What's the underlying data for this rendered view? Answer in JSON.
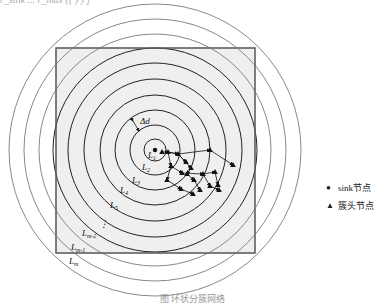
{
  "top_fragment": "r_sink  ...  r_max  ((  )  )  ]",
  "diagram": {
    "center": [
      155,
      150
    ],
    "square": {
      "x": 56,
      "y": 48,
      "w": 199,
      "h": 205,
      "fill": "#efefef",
      "stroke": "#666666"
    },
    "rings_black": [
      11,
      25,
      40,
      55,
      71,
      87,
      102
    ],
    "rings_gray": [
      116,
      131,
      146
    ],
    "ring_labels": [
      {
        "text": "L",
        "sub": "1",
        "x": 148,
        "y": 158
      },
      {
        "text": "L",
        "sub": "2",
        "x": 142,
        "y": 170
      },
      {
        "text": "L",
        "sub": "3",
        "x": 132,
        "y": 183
      },
      {
        "text": "L",
        "sub": "4",
        "x": 120,
        "y": 193
      },
      {
        "text": "L",
        "sub": "5",
        "x": 110,
        "y": 208
      },
      {
        "text": "L",
        "sub": "m-2",
        "x": 82,
        "y": 236
      },
      {
        "text": "L",
        "sub": "m-1",
        "x": 71,
        "y": 250
      },
      {
        "text": "L",
        "sub": "m",
        "x": 69,
        "y": 264
      }
    ],
    "delta_label": "Δd",
    "ellipsis": "⋮",
    "sink_color": "#111111",
    "edges": [
      [
        [
          162,
          152
        ],
        [
          168,
          152
        ],
        [
          178,
          154
        ]
      ],
      [
        [
          168,
          152
        ],
        [
          178,
          154
        ],
        [
          186,
          162
        ]
      ],
      [
        [
          178,
          154
        ],
        [
          210,
          150
        ],
        [
          233,
          165
        ]
      ],
      [
        [
          178,
          154
        ],
        [
          191,
          168
        ],
        [
          187,
          174
        ],
        [
          194,
          180
        ]
      ],
      [
        [
          168,
          152
        ],
        [
          171,
          166
        ],
        [
          182,
          173
        ],
        [
          203,
          174
        ],
        [
          215,
          172
        ],
        [
          218,
          185
        ]
      ],
      [
        [
          171,
          166
        ],
        [
          167,
          180
        ],
        [
          181,
          189
        ],
        [
          193,
          194
        ]
      ],
      [
        [
          203,
          174
        ],
        [
          210,
          186
        ],
        [
          219,
          190
        ]
      ],
      [
        [
          194,
          180
        ],
        [
          200,
          190
        ]
      ]
    ],
    "nodes": [
      [
        162,
        152
      ],
      [
        168,
        152
      ],
      [
        178,
        154
      ],
      [
        186,
        162
      ],
      [
        194,
        180
      ],
      [
        210,
        150
      ],
      [
        233,
        165
      ],
      [
        191,
        168
      ],
      [
        187,
        174
      ],
      [
        171,
        166
      ],
      [
        182,
        173
      ],
      [
        203,
        174
      ],
      [
        215,
        172
      ],
      [
        218,
        185
      ],
      [
        167,
        180
      ],
      [
        181,
        189
      ],
      [
        193,
        194
      ],
      [
        210,
        186
      ],
      [
        219,
        190
      ],
      [
        200,
        190
      ]
    ]
  },
  "legend": {
    "items": [
      {
        "symbol": "●",
        "label": "sink节点"
      },
      {
        "symbol": "▲",
        "label": "簇头节点"
      }
    ]
  },
  "caption": "图    环状分簇网络"
}
